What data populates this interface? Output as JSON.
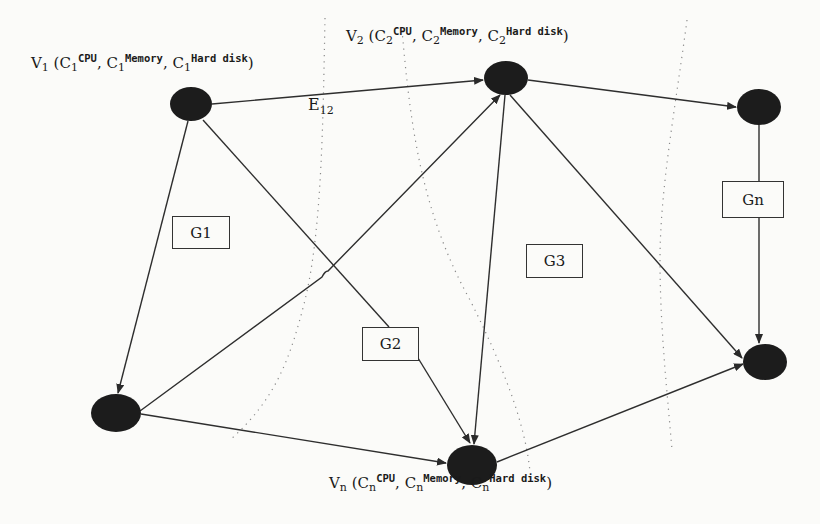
{
  "diagram": {
    "type": "directed-graph",
    "colors": {
      "node_fill": "#1a1a1a",
      "edge": "#333333",
      "dotted_separator": "#888888",
      "background": "#fbfbf9"
    },
    "nodes": [
      {
        "id": "V1",
        "label_main": "V",
        "label_sub": "1",
        "resources": [
          {
            "c": "C",
            "sub": "1",
            "sup": "CPU"
          },
          {
            "c": "C",
            "sub": "1",
            "sup": "Memory"
          },
          {
            "c": "C",
            "sub": "1",
            "sup": "Hard disk"
          }
        ]
      },
      {
        "id": "V2",
        "label_main": "V",
        "label_sub": "2",
        "resources": [
          {
            "c": "C",
            "sub": "2",
            "sup": "CPU"
          },
          {
            "c": "C",
            "sub": "2",
            "sup": "Memory"
          },
          {
            "c": "C",
            "sub": "2",
            "sup": "Hard disk"
          }
        ]
      },
      {
        "id": "Vn",
        "label_main": "V",
        "label_sub": "n",
        "resources": [
          {
            "c": "C",
            "sub": "n",
            "sup": "CPU"
          },
          {
            "c": "C",
            "sub": "n",
            "sup": "Memory"
          },
          {
            "c": "C",
            "sub": "n",
            "sup": "Hard disk"
          }
        ]
      },
      {
        "id": "top-right",
        "unlabeled": true
      },
      {
        "id": "bottom-left",
        "unlabeled": true
      },
      {
        "id": "bottom-right",
        "unlabeled": true
      }
    ],
    "edge_label": {
      "main": "E",
      "sub": "12"
    },
    "groups": [
      "G1",
      "G2",
      "G3",
      "Gn"
    ],
    "edges": [
      [
        "V1",
        "V2"
      ],
      [
        "V2",
        "top-right"
      ],
      [
        "V1",
        "bottom-left"
      ],
      [
        "V1",
        "Vn"
      ],
      [
        "bottom-left",
        "V2"
      ],
      [
        "bottom-left",
        "Vn"
      ],
      [
        "V2",
        "Vn"
      ],
      [
        "V2",
        "bottom-right"
      ],
      [
        "top-right",
        "bottom-right"
      ],
      [
        "Vn",
        "bottom-right"
      ]
    ]
  },
  "labels": {
    "v1": {
      "v": "V",
      "vsub": "1",
      "open": " (",
      "c": "C",
      "csub": "1",
      "cpu": "CPU",
      "mem": "Memory",
      "hd": "Hard disk",
      "sep": ", ",
      "close": ")"
    },
    "v2": {
      "v": "V",
      "vsub": "2",
      "open": " (",
      "c": "C",
      "csub": "2",
      "cpu": "CPU",
      "mem": "Memory",
      "hd": "Hard disk",
      "sep": ", ",
      "close": ")"
    },
    "vn": {
      "v": "V",
      "vsub": "n",
      "open": " (",
      "c": "C",
      "csub": "n",
      "cpu": "CPU",
      "mem": "Memory",
      "hd": "Hard disk",
      "sep": ", ",
      "close": ")"
    },
    "e12": {
      "main": "E",
      "sub": "12"
    },
    "g1": "G1",
    "g2": "G2",
    "g3": "G3",
    "gn": "Gn"
  }
}
